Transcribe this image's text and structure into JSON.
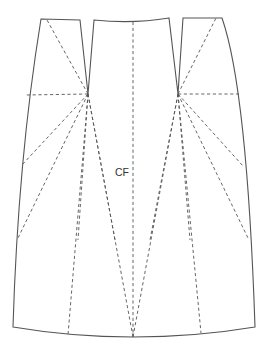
{
  "diagram": {
    "type": "sewing-pattern",
    "labels": {
      "center_front": "CF"
    },
    "colors": {
      "line": "#555555",
      "text": "#333333",
      "background": "#ffffff"
    },
    "points": {
      "left_waist_side": [
        41,
        19
      ],
      "left_dart_outer": [
        80,
        20
      ],
      "left_dart_apex": [
        88,
        94
      ],
      "left_dart_inner": [
        94,
        20
      ],
      "center_waist": [
        133,
        22
      ],
      "right_dart_inner": [
        169,
        18
      ],
      "right_dart_apex": [
        178,
        94
      ],
      "right_dart_outer": [
        183,
        18
      ],
      "right_waist_side": [
        222,
        18
      ],
      "left_hem": [
        13,
        327
      ],
      "center_hem": [
        133,
        337
      ],
      "right_hem": [
        255,
        327
      ]
    }
  }
}
